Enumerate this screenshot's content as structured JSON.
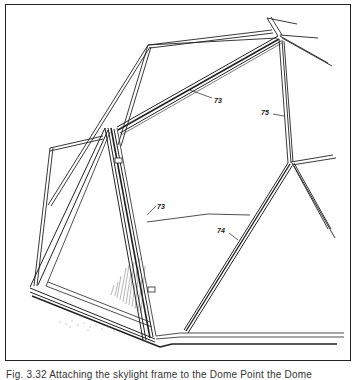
{
  "figure": {
    "callouts": [
      {
        "id": "73a",
        "label": "73",
        "x": 214,
        "y": 101
      },
      {
        "id": "75",
        "label": "75",
        "x": 262,
        "y": 112
      },
      {
        "id": "73b",
        "label": "73",
        "x": 157,
        "y": 208
      },
      {
        "id": "74",
        "label": "74",
        "x": 217,
        "y": 232
      }
    ],
    "caption": "Fig. 3.32 Attaching the skylight frame to the Dome Point the Dome"
  }
}
